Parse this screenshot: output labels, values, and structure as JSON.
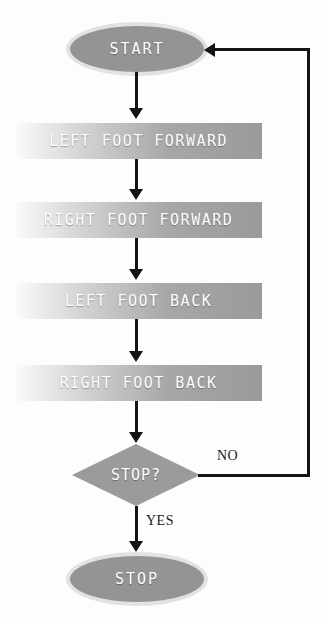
{
  "diagram": {
    "background_color": "#fdfdfd",
    "nodes": {
      "start": {
        "label": "START",
        "type": "terminator",
        "fill": "#949494"
      },
      "step1": {
        "label": "LEFT FOOT FORWARD",
        "type": "process"
      },
      "step2": {
        "label": "RIGHT FOOT FORWARD",
        "type": "process"
      },
      "step3": {
        "label": "LEFT FOOT BACK",
        "type": "process"
      },
      "step4": {
        "label": "RIGHT FOOT BACK",
        "type": "process"
      },
      "decision": {
        "label": "STOP?",
        "type": "decision",
        "fill": "#9b9b9b"
      },
      "end": {
        "label": "STOP",
        "type": "terminator",
        "fill": "#949494"
      }
    },
    "edges": {
      "yes_label": "YES",
      "no_label": "NO",
      "line_color": "#141414"
    }
  }
}
